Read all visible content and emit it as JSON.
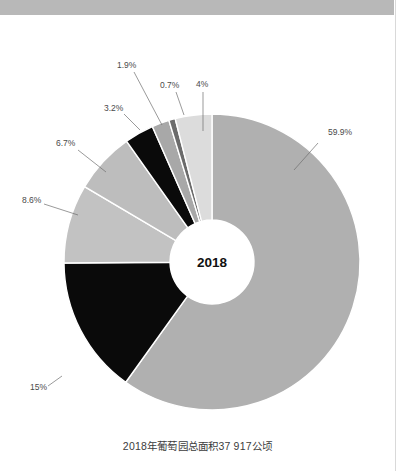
{
  "page": {
    "background_color": "#ffffff",
    "top_band_color": "#b8b8b8",
    "rule_color": "#d9d9d9"
  },
  "caption": {
    "text": "2018年葡萄园总面积37 917公顷"
  },
  "center": {
    "year_label": "2018"
  },
  "chart_data": {
    "type": "pie",
    "variant": "donut",
    "title": "",
    "subtitle": "",
    "caption": "2018年葡萄园总面积37 917公顷",
    "center_label": "2018",
    "total_area_hectares": "37 917",
    "unit": "公顷",
    "year": "2018",
    "xlabel": "",
    "ylabel": "",
    "legend_position": "none",
    "grid": false,
    "labels_are_outside": true,
    "start_angle_deg": 0,
    "direction": "clockwise",
    "categories": [
      "59.9%",
      "15%",
      "8.6%",
      "6.7%",
      "3.2%",
      "1.9%",
      "0.7%",
      "4%"
    ],
    "values": [
      59.9,
      15,
      8.6,
      6.7,
      3.2,
      1.9,
      0.7,
      4
    ],
    "slices": [
      {
        "label": "59.9%",
        "value": 59.9,
        "color": "#b0b0b0",
        "label_x": 328,
        "label_y": 120,
        "line_x1": 318,
        "line_y1": 128,
        "line_x2": 294,
        "line_y2": 155
      },
      {
        "label": "15%",
        "value": 15,
        "color": "#0a0a0a",
        "label_x": 30,
        "label_y": 375,
        "line_x1": 48,
        "line_y1": 371,
        "line_x2": 62,
        "line_y2": 361
      },
      {
        "label": "8.6%",
        "value": 8.6,
        "color": "#c2c2c2",
        "label_x": 22,
        "label_y": 188,
        "line_x1": 44,
        "line_y1": 189,
        "line_x2": 78,
        "line_y2": 200
      },
      {
        "label": "6.7%",
        "value": 6.7,
        "color": "#bdbdbd",
        "label_x": 56,
        "label_y": 131,
        "line_x1": 78,
        "line_y1": 135,
        "line_x2": 106,
        "line_y2": 157
      },
      {
        "label": "3.2%",
        "value": 3.2,
        "color": "#0a0a0a",
        "label_x": 104,
        "label_y": 96,
        "line_x1": 124,
        "line_y1": 99,
        "line_x2": 140,
        "line_y2": 115
      },
      {
        "label": "1.9%",
        "value": 1.9,
        "color": "#a8a8a8",
        "label_x": 117,
        "label_y": 53,
        "line_x1": 134,
        "line_y1": 57,
        "line_x2": 162,
        "line_y2": 110
      },
      {
        "label": "0.7%",
        "value": 0.7,
        "color": "#6b6b6b",
        "label_x": 160,
        "label_y": 73,
        "line_x1": 176,
        "line_y1": 77,
        "line_x2": 184,
        "line_y2": 100
      },
      {
        "label": "4%",
        "value": 4,
        "color": "#dcdcdc",
        "label_x": 196,
        "label_y": 72,
        "line_x1": 203,
        "line_y1": 77,
        "line_x2": 203,
        "line_y2": 116
      }
    ],
    "geometry": {
      "cx": 212,
      "cy": 247,
      "outer_radius": 148,
      "inner_radius": 42,
      "separator_color": "#ffffff"
    }
  }
}
